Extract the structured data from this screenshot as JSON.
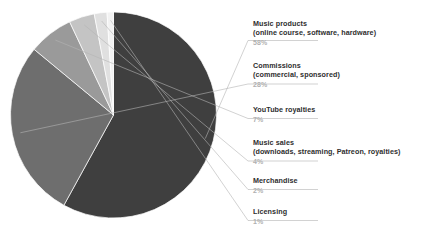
{
  "chart_data": {
    "type": "pie",
    "title": "",
    "legend_position": "right",
    "total_pct": 100,
    "categories": [
      "Music products (online course, software, hardware)",
      "Commissions (commercial, sponsored)",
      "YouTube royalties",
      "Music sales (downloads, streaming, Patreon, royalties)",
      "Merchandise",
      "Licensing"
    ],
    "values": [
      58,
      28,
      7,
      4,
      2,
      1
    ],
    "slices": [
      {
        "label": "Music products",
        "sublabel": "(online course, software, hardware)",
        "value": 58,
        "pct_text": "58%",
        "color": "#3f3f3f"
      },
      {
        "label": "Commissions",
        "sublabel": "(commercial, sponsored)",
        "value": 28,
        "pct_text": "28%",
        "color": "#6e6e6e"
      },
      {
        "label": "YouTube royalties",
        "sublabel": "",
        "value": 7,
        "pct_text": "7%",
        "color": "#9a9a9a"
      },
      {
        "label": "Music sales",
        "sublabel": "(downloads, streaming, Patreon, royalties)",
        "value": 4,
        "pct_text": "4%",
        "color": "#c4c4c4"
      },
      {
        "label": "Merchandise",
        "sublabel": "",
        "value": 2,
        "pct_text": "2%",
        "color": "#e0e0e0"
      },
      {
        "label": "Licensing",
        "sublabel": "",
        "value": 1,
        "pct_text": "1%",
        "color": "#f2f2f2"
      }
    ]
  },
  "style": {
    "background": "#ffffff",
    "leader_line_color": "#b4b4b4",
    "label_color": "#2e2e2e",
    "pct_color": "#b0b0b0"
  }
}
